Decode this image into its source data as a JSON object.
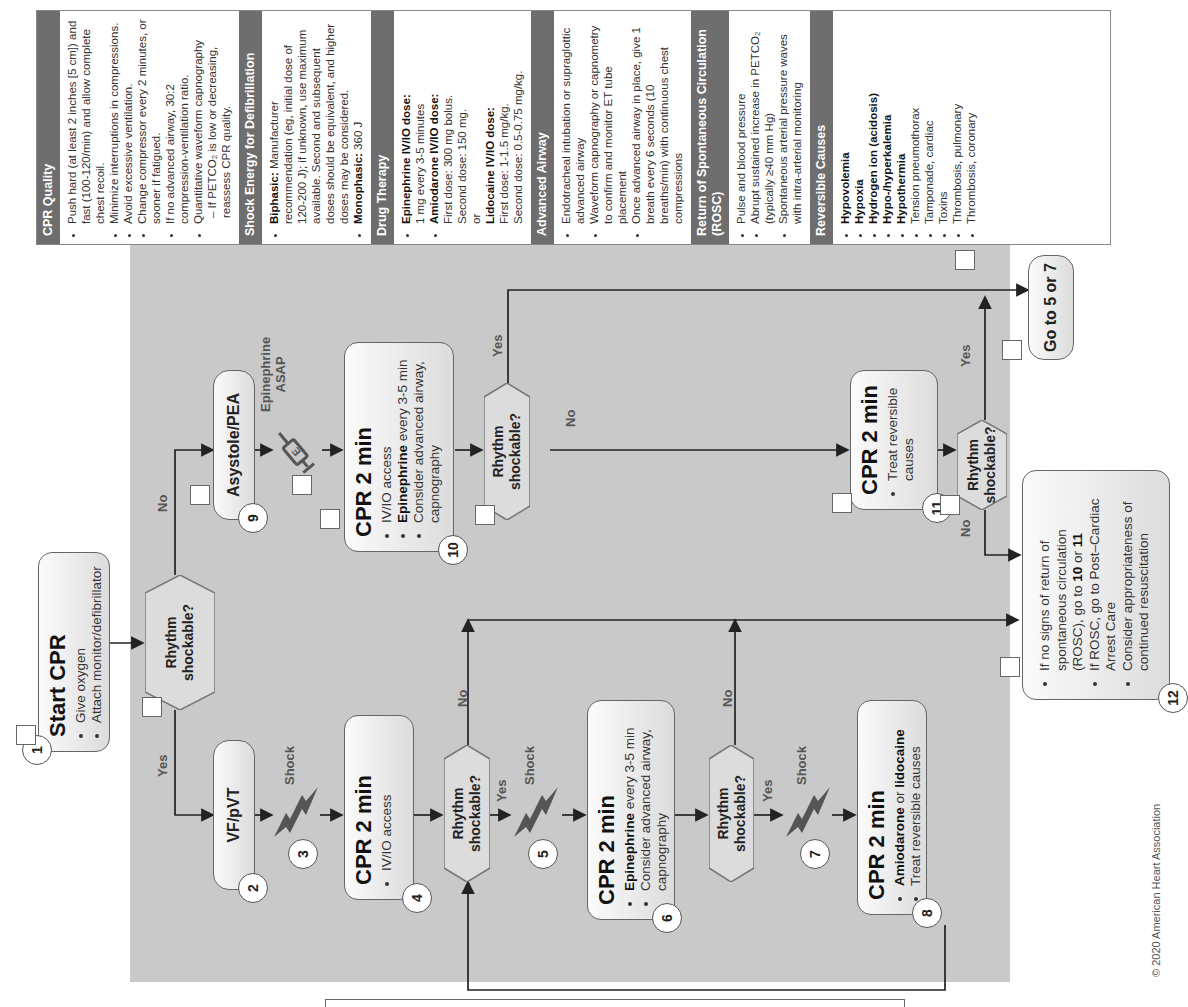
{
  "flowchart": {
    "nodes": {
      "n1": {
        "number": "1",
        "title": "Start CPR",
        "bullets": [
          "Give oxygen",
          "Attach monitor/defibrillator"
        ]
      },
      "n2": {
        "number": "2",
        "title": "VF/pVT"
      },
      "n3": {
        "number": "3",
        "label": "Shock"
      },
      "n4": {
        "number": "4",
        "title": "CPR 2 min",
        "bullets": [
          "IV/IO access"
        ]
      },
      "n5": {
        "number": "5",
        "label": "Shock"
      },
      "n6": {
        "number": "6",
        "title": "CPR 2 min",
        "bullets": [
          {
            "bold": "Epinephrine",
            "rest": " every 3-5 min"
          },
          "Consider advanced airway, capnography"
        ]
      },
      "n7": {
        "number": "7",
        "label": "Shock"
      },
      "n8": {
        "number": "8",
        "title": "CPR 2 min",
        "bullets": [
          {
            "bold": "Amiodarone",
            "rest": " or ",
            "bold2": "lidocaine"
          },
          "Treat reversible causes"
        ]
      },
      "n9": {
        "number": "9",
        "title": "Asystole/PEA"
      },
      "epi": {
        "label": "Epinephrine ASAP",
        "line1": "Epinephrine",
        "line2": "ASAP"
      },
      "n10": {
        "number": "10",
        "title": "CPR 2 min",
        "bullets": [
          "IV/IO access",
          {
            "bold": "Epinephrine",
            "rest": " every 3-5 min"
          },
          "Consider advanced airway, capnography"
        ]
      },
      "n11": {
        "number": "11",
        "title": "CPR 2 min",
        "bullets": [
          "Treat reversible causes"
        ]
      },
      "n12": {
        "number": "12",
        "bullets": [
          "If no signs of return of spontaneous circulation (ROSC), go to 10 or 11",
          "If ROSC, go to Post–Cardiac Arrest Care",
          "Consider appropriateness of continued resuscitation"
        ],
        "b1a": "If no signs of return of spontaneous circulation (ROSC), go to ",
        "b1b": "10",
        "b1c": " or ",
        "b1d": "11",
        "b2": "If ROSC, go to Post–Cardiac Arrest Care",
        "b3": "Consider appropriateness of continued resuscitation"
      },
      "goto": {
        "title": "Go to 5 or 7"
      }
    },
    "decision_label_line1": "Rhythm",
    "decision_label_line2": "shockable?",
    "yes": "Yes",
    "no": "No"
  },
  "sidebar": {
    "cpr_quality": {
      "title": "CPR Quality",
      "items": [
        "Push hard (at least 2 inches [5 cm]) and fast (100-120/min) and allow complete chest recoil.",
        "Minimize interruptions in compressions.",
        "Avoid excessive ventilation.",
        "Change compressor every 2 minutes, or sooner if fatigued.",
        "If no advanced airway, 30:2 compression-ventilation ratio.",
        "Quantitative waveform capnography"
      ],
      "sub_item": "– If PETCO₂ is low or decreasing, reassess CPR quality."
    },
    "shock_energy": {
      "title": "Shock Energy for Defibrillation",
      "biphasic_label": "Biphasic:",
      "biphasic_text": " Manufacturer recommendation (eg, initial dose of 120-200 J); if unknown, use maximum available. Second and subsequent doses should be equivalent, and higher doses may be considered.",
      "monophasic_label": "Monophasic:",
      "monophasic_text": " 360 J"
    },
    "drug_therapy": {
      "title": "Drug Therapy",
      "epi_label": "Epinephrine IV/IO dose:",
      "epi_text": "1 mg every 3-5 minutes",
      "amio_label": "Amiodarone IV/IO dose:",
      "amio_first": "First dose: 300 mg bolus.",
      "amio_second": "Second dose: 150 mg.",
      "or": "or",
      "lido_label": "Lidocaine IV/IO dose:",
      "lido_first": "First dose: 1-1.5 mg/kg.",
      "lido_second": "Second dose: 0.5-0.75 mg/kg."
    },
    "advanced_airway": {
      "title": "Advanced Airway",
      "items": [
        "Endotracheal intubation or supraglottic advanced airway",
        "Waveform capnography or capnometry to confirm and monitor ET tube placement",
        "Once advanced airway in place, give 1 breath every 6 seconds (10 breaths/min) with continuous chest compressions"
      ]
    },
    "rosc": {
      "title": "Return of Spontaneous Circulation (ROSC)",
      "items": [
        "Pulse and blood pressure",
        "Abrupt sustained increase in PETCO₂ (typically ≥40 mm Hg)",
        "Spontaneous arterial pressure waves with intra-arterial monitoring"
      ]
    },
    "reversible_causes": {
      "title": "Reversible Causes",
      "items_bold": [
        "Hypovolemia",
        "Hypoxia",
        "Hydrogen ion (acidosis)",
        "Hypo-/hyperkalemia",
        "Hypothermia"
      ],
      "items_plain": [
        "Tension pneumothorax",
        "Tamponade, cardiac",
        "Toxins",
        "Thrombosis, pulmonary",
        "Thrombosis, coronary"
      ]
    }
  },
  "copyright": "© 2020 American Heart Association",
  "colors": {
    "header_bg": "#6e6e6e",
    "shaded_region": "#c9c9c9",
    "shock_icon": "#555555",
    "line": "#222222"
  }
}
